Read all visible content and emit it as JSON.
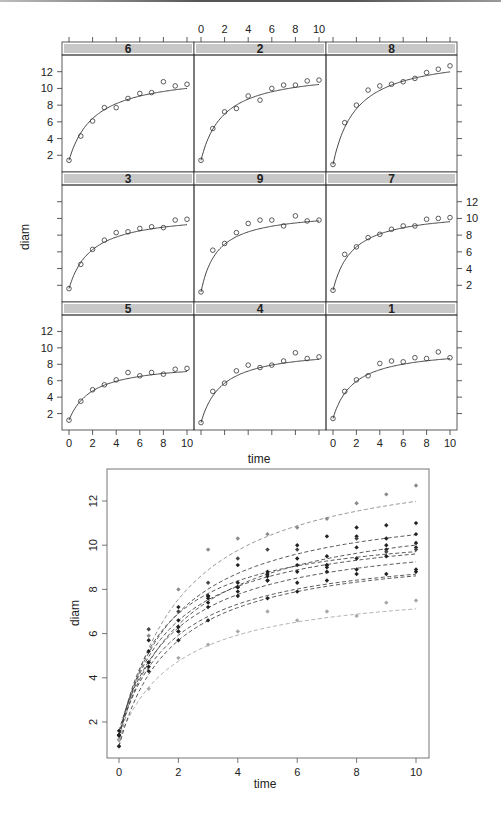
{
  "chart_data": [
    {
      "type": "scatter",
      "title": "",
      "layout": "trellis 3x3",
      "xlabel": "time",
      "ylabel": "diam",
      "xlim": [
        0,
        10
      ],
      "ylim": [
        0,
        14
      ],
      "x_ticks": [
        0,
        2,
        4,
        6,
        8,
        10
      ],
      "y_ticks": [
        2,
        4,
        6,
        8,
        10,
        12
      ],
      "x": [
        0,
        1,
        2,
        3,
        4,
        5,
        6,
        7,
        8,
        9,
        10
      ],
      "strip_color": "#c8c8c8",
      "panels": [
        {
          "label": "6",
          "values": [
            1.4,
            4.3,
            6.1,
            7.7,
            7.7,
            8.8,
            9.4,
            9.5,
            10.8,
            10.3,
            10.5
          ],
          "fit": {
            "a": 11.9,
            "b": 2.2,
            "c": 1.4
          }
        },
        {
          "label": "2",
          "values": [
            1.4,
            5.2,
            7.2,
            7.6,
            9.1,
            8.6,
            10.0,
            10.4,
            10.4,
            10.9,
            11.0
          ],
          "fit": {
            "a": 12.2,
            "b": 1.9,
            "c": 1.4
          }
        },
        {
          "label": "8",
          "values": [
            0.9,
            5.9,
            8.0,
            9.8,
            10.3,
            10.5,
            10.8,
            11.2,
            11.9,
            12.3,
            12.7
          ],
          "fit": {
            "a": 14.2,
            "b": 2.0,
            "c": 0.9
          }
        },
        {
          "label": "3",
          "values": [
            1.6,
            4.5,
            6.3,
            7.4,
            8.3,
            8.4,
            8.8,
            9.0,
            8.9,
            9.8,
            9.9
          ],
          "fit": {
            "a": 10.7,
            "b": 1.9,
            "c": 1.6
          }
        },
        {
          "label": "9",
          "values": [
            1.2,
            6.2,
            7.0,
            8.3,
            9.4,
            9.8,
            9.8,
            9.1,
            10.3,
            9.7,
            9.8
          ],
          "fit": {
            "a": 10.9,
            "b": 1.4,
            "c": 1.2
          }
        },
        {
          "label": "7",
          "values": [
            1.4,
            5.7,
            6.6,
            7.7,
            8.1,
            8.7,
            9.1,
            9.1,
            9.9,
            10.0,
            10.1
          ],
          "fit": {
            "a": 11.0,
            "b": 1.7,
            "c": 1.4
          }
        },
        {
          "label": "5",
          "values": [
            1.2,
            3.5,
            4.9,
            5.5,
            6.1,
            7.0,
            6.6,
            7.0,
            6.8,
            7.4,
            7.5
          ],
          "fit": {
            "a": 8.3,
            "b": 2.0,
            "c": 1.2
          }
        },
        {
          "label": "4",
          "values": [
            0.9,
            4.7,
            5.7,
            7.2,
            7.9,
            7.6,
            7.9,
            8.4,
            9.4,
            8.7,
            8.9
          ],
          "fit": {
            "a": 10.0,
            "b": 1.8,
            "c": 0.9
          }
        },
        {
          "label": "1",
          "values": [
            1.4,
            4.7,
            6.1,
            6.6,
            8.1,
            8.4,
            8.3,
            8.8,
            8.7,
            9.5,
            8.8
          ],
          "fit": {
            "a": 10.0,
            "b": 1.8,
            "c": 1.4
          }
        }
      ]
    },
    {
      "type": "scatter",
      "title": "",
      "xlabel": "time",
      "ylabel": "diam",
      "xlim": [
        -0.3,
        10.4
      ],
      "ylim": [
        0.6,
        13.2
      ],
      "x_ticks": [
        0,
        2,
        4,
        6,
        8,
        10
      ],
      "y_ticks": [
        2,
        4,
        6,
        8,
        10,
        12
      ],
      "grid": false,
      "line_style": "dashed",
      "note": "All nine trees overlaid; fitted curves drawn dashed, points as small filled diamonds; tree 8 (top) and tree 5 (bottom) shown in lighter gray",
      "x": [
        0,
        1,
        2,
        3,
        4,
        5,
        6,
        7,
        8,
        9,
        10
      ],
      "series": [
        {
          "name": "6",
          "color": "#222222",
          "values": [
            1.4,
            4.3,
            6.1,
            7.7,
            7.7,
            8.8,
            9.4,
            9.5,
            10.8,
            10.3,
            10.5
          ]
        },
        {
          "name": "2",
          "color": "#222222",
          "values": [
            1.4,
            5.2,
            7.2,
            7.6,
            9.1,
            8.6,
            10.0,
            10.4,
            10.4,
            10.9,
            11.0
          ]
        },
        {
          "name": "8",
          "color": "#8a8a8a",
          "values": [
            0.9,
            5.9,
            8.0,
            9.8,
            10.3,
            10.5,
            10.8,
            11.2,
            11.9,
            12.3,
            12.7
          ]
        },
        {
          "name": "3",
          "color": "#222222",
          "values": [
            1.6,
            4.5,
            6.3,
            7.4,
            8.3,
            8.4,
            8.8,
            9.0,
            8.9,
            9.8,
            9.9
          ]
        },
        {
          "name": "9",
          "color": "#444444",
          "values": [
            1.2,
            6.2,
            7.0,
            8.3,
            9.4,
            9.8,
            9.8,
            9.1,
            10.3,
            9.7,
            9.8
          ]
        },
        {
          "name": "7",
          "color": "#222222",
          "values": [
            1.4,
            5.7,
            6.6,
            7.7,
            8.1,
            8.7,
            9.1,
            9.1,
            9.9,
            10.0,
            10.1
          ]
        },
        {
          "name": "5",
          "color": "#a8a8a8",
          "values": [
            1.2,
            3.5,
            4.9,
            5.5,
            6.1,
            7.0,
            6.6,
            7.0,
            6.8,
            7.4,
            7.5
          ]
        },
        {
          "name": "4",
          "color": "#222222",
          "values": [
            0.9,
            4.7,
            5.7,
            7.2,
            7.9,
            7.6,
            7.9,
            8.4,
            9.4,
            8.7,
            8.9
          ]
        },
        {
          "name": "1",
          "color": "#222222",
          "values": [
            1.4,
            4.7,
            6.1,
            6.6,
            8.1,
            8.4,
            8.3,
            8.8,
            8.7,
            9.5,
            8.8
          ]
        }
      ]
    }
  ]
}
